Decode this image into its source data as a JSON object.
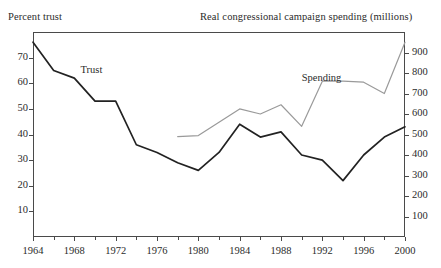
{
  "header": {
    "left_title": "Percent trust",
    "right_title": "Real congressional campaign spending (millions)"
  },
  "series_labels": {
    "trust": "Trust",
    "spending": "Spending"
  },
  "chart_data": {
    "type": "line",
    "title": "",
    "subtitle": "",
    "xlabel": "",
    "ylabel": "Percent trust",
    "y2label": "Real congressional campaign spending (millions)",
    "grid": false,
    "legend": "inline-annotations",
    "xlim": [
      1964,
      2000
    ],
    "ylim": [
      0,
      80
    ],
    "y2lim": [
      0,
      1000
    ],
    "xticks": [
      1964,
      1968,
      1972,
      1976,
      1980,
      1984,
      1988,
      1992,
      1996,
      2000
    ],
    "xtick_labels": [
      "1964",
      "1968",
      "1972",
      "1976",
      "1980",
      "1984",
      "1988",
      "1992",
      "1996",
      "2000"
    ],
    "xminor_ticks": [
      1966,
      1970,
      1974,
      1978,
      1982,
      1986,
      1990,
      1994,
      1998
    ],
    "yticks": [
      10,
      20,
      30,
      40,
      50,
      60,
      70
    ],
    "ytick_labels": [
      "10",
      "20",
      "30",
      "40",
      "50",
      "60",
      "70"
    ],
    "y2ticks": [
      100,
      200,
      300,
      400,
      500,
      600,
      700,
      800,
      900
    ],
    "y2tick_labels": [
      "100",
      "200",
      "300",
      "400",
      "500",
      "600",
      "700",
      "800",
      "900"
    ],
    "series": [
      {
        "name": "Trust",
        "axis": "left",
        "color": "#222222",
        "x": [
          1964,
          1966,
          1968,
          1970,
          1972,
          1974,
          1976,
          1978,
          1980,
          1982,
          1984,
          1986,
          1988,
          1990,
          1992,
          1994,
          1996,
          1998,
          2000
        ],
        "values": [
          76,
          65,
          62,
          53,
          53,
          36,
          33,
          29,
          26,
          33,
          44,
          39,
          41,
          32,
          30,
          22,
          32,
          39,
          43
        ]
      },
      {
        "name": "Spending",
        "axis": "right",
        "color": "#9a9a9a",
        "x": [
          1978,
          1980,
          1982,
          1984,
          1986,
          1988,
          1990,
          1992,
          1994,
          1996,
          1998,
          2000
        ],
        "values": [
          490,
          495,
          560,
          625,
          600,
          645,
          540,
          760,
          760,
          755,
          700,
          950
        ]
      }
    ],
    "annotations": [
      {
        "text": "Trust",
        "x": 1968.6,
        "y": 65
      },
      {
        "text": "Spending",
        "x": 1990.0,
        "y": 775
      }
    ]
  },
  "colors": {
    "trust_line": "#222222",
    "spending_line": "#9a9a9a",
    "axis": "#4a4a4a",
    "text": "#2b2b2b",
    "background": "#ffffff"
  }
}
